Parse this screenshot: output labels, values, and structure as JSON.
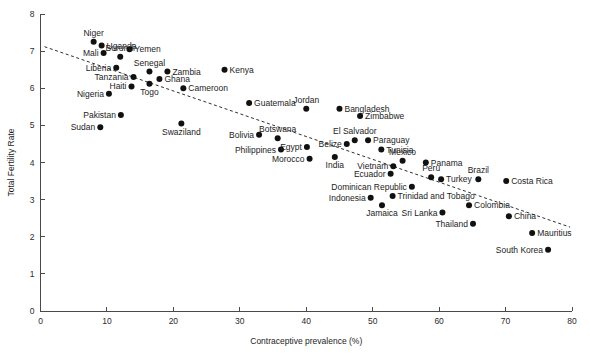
{
  "chart_data": {
    "type": "scatter",
    "title": "",
    "xlabel": "Contraceptive prevalence (%)",
    "ylabel": "Total Fertility Rate",
    "xlim": [
      0,
      80
    ],
    "ylim": [
      0,
      8
    ],
    "xticks": [
      0,
      10,
      20,
      30,
      40,
      50,
      60,
      70,
      80
    ],
    "yticks": [
      0,
      1,
      2,
      3,
      4,
      5,
      6,
      7,
      8
    ],
    "grid": false,
    "legend": "none",
    "trend_line": {
      "style": "dashed",
      "x_start": 0.6,
      "y_start": 7.12,
      "x_end": 79.7,
      "y_end": 2.26,
      "label": "fitted-regression-line"
    },
    "point_label_key": "country",
    "points": [
      {
        "country": "Niger",
        "x": 8.0,
        "y": 7.25,
        "label_pos": "top"
      },
      {
        "country": "Uganda",
        "x": 9.2,
        "y": 7.15,
        "label_pos": "right"
      },
      {
        "country": "Mali",
        "x": 9.5,
        "y": 6.95,
        "label_pos": "left"
      },
      {
        "country": "Yemen",
        "x": 13.4,
        "y": 7.05,
        "label_pos": "right"
      },
      {
        "country": "Burundi",
        "x": 12.0,
        "y": 6.85,
        "label_pos": "top"
      },
      {
        "country": "Liberia",
        "x": 11.4,
        "y": 6.55,
        "label_pos": "left"
      },
      {
        "country": "Senegal",
        "x": 16.4,
        "y": 6.45,
        "label_pos": "top"
      },
      {
        "country": "Zambia",
        "x": 19.1,
        "y": 6.45,
        "label_pos": "right"
      },
      {
        "country": "Tanzania",
        "x": 14.0,
        "y": 6.3,
        "label_pos": "left"
      },
      {
        "country": "Ghana",
        "x": 17.9,
        "y": 6.25,
        "label_pos": "right"
      },
      {
        "country": "Cameroon",
        "x": 21.5,
        "y": 6.0,
        "label_pos": "right"
      },
      {
        "country": "Haiti",
        "x": 13.7,
        "y": 6.05,
        "label_pos": "left"
      },
      {
        "country": "Togo",
        "x": 16.4,
        "y": 6.12,
        "label_pos": "bottom"
      },
      {
        "country": "Nigeria",
        "x": 10.3,
        "y": 5.85,
        "label_pos": "left"
      },
      {
        "country": "Kenya",
        "x": 27.7,
        "y": 6.5,
        "label_pos": "right"
      },
      {
        "country": "Guatemala",
        "x": 31.4,
        "y": 5.6,
        "label_pos": "right"
      },
      {
        "country": "Jordan",
        "x": 40.0,
        "y": 5.45,
        "label_pos": "top"
      },
      {
        "country": "Bangladesh",
        "x": 45.0,
        "y": 5.45,
        "label_pos": "right"
      },
      {
        "country": "Zimbabwe",
        "x": 48.1,
        "y": 5.25,
        "label_pos": "right"
      },
      {
        "country": "Pakistan",
        "x": 12.1,
        "y": 5.28,
        "label_pos": "left"
      },
      {
        "country": "Sudan",
        "x": 9.0,
        "y": 4.95,
        "label_pos": "left"
      },
      {
        "country": "Swaziland",
        "x": 21.2,
        "y": 5.05,
        "label_pos": "bottom"
      },
      {
        "country": "Bolivia",
        "x": 32.9,
        "y": 4.75,
        "label_pos": "left"
      },
      {
        "country": "Botswana",
        "x": 35.7,
        "y": 4.65,
        "label_pos": "top"
      },
      {
        "country": "El Salvador",
        "x": 47.3,
        "y": 4.6,
        "label_pos": "top"
      },
      {
        "country": "Paraguay",
        "x": 49.3,
        "y": 4.6,
        "label_pos": "right"
      },
      {
        "country": "Belize",
        "x": 46.1,
        "y": 4.5,
        "label_pos": "left"
      },
      {
        "country": "Philippines",
        "x": 36.2,
        "y": 4.35,
        "label_pos": "left"
      },
      {
        "country": "Egypt",
        "x": 40.1,
        "y": 4.42,
        "label_pos": "left"
      },
      {
        "country": "Tunisia",
        "x": 51.3,
        "y": 4.35,
        "label_pos": "right"
      },
      {
        "country": "Morocco",
        "x": 40.5,
        "y": 4.1,
        "label_pos": "left"
      },
      {
        "country": "India",
        "x": 44.3,
        "y": 4.15,
        "label_pos": "bottom"
      },
      {
        "country": "Mexico",
        "x": 54.5,
        "y": 4.05,
        "label_pos": "top"
      },
      {
        "country": "Panama",
        "x": 58.0,
        "y": 4.0,
        "label_pos": "right"
      },
      {
        "country": "Vietnam",
        "x": 53.1,
        "y": 3.9,
        "label_pos": "left"
      },
      {
        "country": "Ecuador",
        "x": 52.7,
        "y": 3.7,
        "label_pos": "left"
      },
      {
        "country": "Peru",
        "x": 58.8,
        "y": 3.6,
        "label_pos": "top"
      },
      {
        "country": "Turkey",
        "x": 60.3,
        "y": 3.55,
        "label_pos": "right"
      },
      {
        "country": "Brazil",
        "x": 65.9,
        "y": 3.55,
        "label_pos": "top"
      },
      {
        "country": "Costa Rica",
        "x": 70.1,
        "y": 3.5,
        "label_pos": "right"
      },
      {
        "country": "Dominican Republic",
        "x": 55.9,
        "y": 3.35,
        "label_pos": "left"
      },
      {
        "country": "Trinidad and Tobago",
        "x": 53.0,
        "y": 3.1,
        "label_pos": "right"
      },
      {
        "country": "Indonesia",
        "x": 49.7,
        "y": 3.05,
        "label_pos": "left"
      },
      {
        "country": "Jamaica",
        "x": 51.4,
        "y": 2.85,
        "label_pos": "bottom"
      },
      {
        "country": "Colombia",
        "x": 64.5,
        "y": 2.85,
        "label_pos": "right"
      },
      {
        "country": "Sri Lanka",
        "x": 60.5,
        "y": 2.65,
        "label_pos": "left"
      },
      {
        "country": "China",
        "x": 70.5,
        "y": 2.55,
        "label_pos": "right"
      },
      {
        "country": "Thailand",
        "x": 65.1,
        "y": 2.35,
        "label_pos": "left"
      },
      {
        "country": "Mauritius",
        "x": 74.0,
        "y": 2.1,
        "label_pos": "right"
      },
      {
        "country": "South Korea",
        "x": 76.4,
        "y": 1.65,
        "label_pos": "left"
      }
    ]
  },
  "colors": {
    "background": "#ffffff",
    "point": "#111111",
    "axis": "#4a4a4a",
    "text": "#1c1c1c",
    "trend": "#2e2e2e"
  }
}
